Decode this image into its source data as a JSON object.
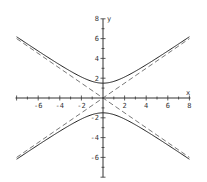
{
  "chart_data": {
    "type": "line",
    "title": "",
    "xlabel": "x",
    "ylabel": "y",
    "xlim": [
      -8,
      8
    ],
    "ylim": [
      -8,
      8
    ],
    "x_ticks": [
      -6,
      -4,
      -2,
      2,
      4,
      6,
      8
    ],
    "y_ticks": [
      8,
      6,
      4,
      2,
      -2,
      -4,
      -6
    ],
    "grid": false,
    "series": [
      {
        "name": "hyperbola",
        "equation": "y^2/2.25 - x^2/4 = 1",
        "style": "solid",
        "vertices": [
          [
            0,
            1.5
          ],
          [
            0,
            -1.5
          ]
        ]
      },
      {
        "name": "asymptote 1",
        "equation": "y = 0.75x",
        "style": "dashed"
      },
      {
        "name": "asymptote 2",
        "equation": "y = -0.75x",
        "style": "dashed"
      }
    ]
  },
  "axis_labels": {
    "x": "x",
    "y": "y"
  }
}
